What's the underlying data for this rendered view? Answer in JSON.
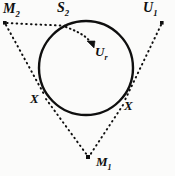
{
  "figure": {
    "name": "tangent-circle-diagram",
    "background_color": "#fbfbfa",
    "ink_color": "#0f0f0f",
    "width": 175,
    "height": 176
  },
  "labels": {
    "m2": {
      "base": "M",
      "sub": "2"
    },
    "s2": {
      "base": "S",
      "sub": "2"
    },
    "u1": {
      "base": "U",
      "sub": "1"
    },
    "ur": {
      "base": "U",
      "sub": "r"
    },
    "x_left": {
      "base": "X",
      "sub": ""
    },
    "x_right": {
      "base": "X",
      "sub": ""
    },
    "m1": {
      "base": "M",
      "sub": "1"
    }
  },
  "geometry": {
    "circle": {
      "cx": 86,
      "cy": 68,
      "r": 47
    },
    "points": [
      {
        "name": "M2",
        "x": 5,
        "y": 23
      },
      {
        "name": "U1",
        "x": 162,
        "y": 23
      },
      {
        "name": "M1",
        "x": 88,
        "y": 158
      },
      {
        "name": "S2",
        "x": 68,
        "y": 25
      },
      {
        "name": "X-left",
        "x": 44,
        "y": 93
      },
      {
        "name": "X-right",
        "x": 127,
        "y": 99
      },
      {
        "name": "Ur-arrow-tip",
        "x": 93,
        "y": 46
      }
    ],
    "dotted_segments": [
      {
        "name": "m2-to-s2",
        "from": "M2",
        "to": "S2"
      },
      {
        "name": "m2-to-x-left",
        "from": "M2",
        "to": "X-left"
      },
      {
        "name": "u1-to-x-right",
        "from": "U1",
        "to": "X-right"
      },
      {
        "name": "m1-to-x-left",
        "from": "M1",
        "to": "X-left"
      },
      {
        "name": "m1-to-x-right",
        "from": "M1",
        "to": "X-right"
      }
    ],
    "curved_arrow": {
      "name": "s2-to-ur-arrow",
      "from": "S2",
      "to": "Ur-arrow-tip"
    }
  }
}
